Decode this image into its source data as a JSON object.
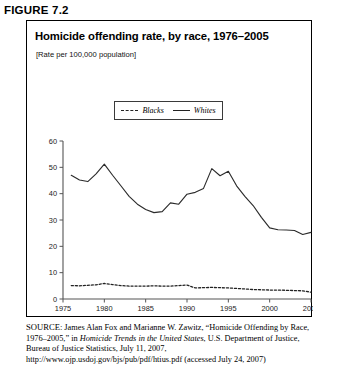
{
  "figure": {
    "label": "FIGURE 7.2",
    "title": "Homicide offending rate, by race, 1976–2005",
    "subtitle": "[Rate per 100,000 population]"
  },
  "legend": {
    "items": [
      {
        "label": "Blacks",
        "style": "dashed"
      },
      {
        "label": "Whites",
        "style": "solid"
      }
    ]
  },
  "source": {
    "prefix": "SOURCE:",
    "text_1": " James Alan Fox and Marianne W. Zawitz, “Homicide Offending by Race, 1976–2005,” in ",
    "italic_1": "Homicide Trends in the United States",
    "text_2": ", U.S. Department of Justice, Bureau of Justice Statistics, July 11, 2007, http://www.ojp.usdoj.gov/bjs/pub/pdf/htius.pdf (accessed July 24, 2007)"
  },
  "chart_data": {
    "type": "line",
    "title": "Homicide offending rate, by race, 1976–2005",
    "xlabel": "",
    "ylabel": "",
    "subtitle": "[Rate per 100,000 population]",
    "xlim": [
      1975,
      2005
    ],
    "ylim": [
      0,
      60
    ],
    "ytick_values": [
      0,
      10,
      20,
      30,
      40,
      50,
      60
    ],
    "ytick_labels": [
      "0",
      "10",
      "20",
      "30",
      "40",
      "50",
      "60"
    ],
    "xtick_values": [
      1975,
      1980,
      1985,
      1990,
      1995,
      2000,
      2005
    ],
    "xtick_labels": [
      "1975",
      "1980",
      "1985",
      "1990",
      "1995",
      "2000",
      "2005"
    ],
    "grid": false,
    "legend_position": "top-center",
    "x": [
      1976,
      1977,
      1978,
      1979,
      1980,
      1981,
      1982,
      1983,
      1984,
      1985,
      1986,
      1987,
      1988,
      1989,
      1990,
      1991,
      1992,
      1993,
      1994,
      1995,
      1996,
      1997,
      1998,
      1999,
      2000,
      2001,
      2002,
      2003,
      2004,
      2005
    ],
    "series": [
      {
        "name": "Blacks",
        "style": "dashed",
        "color": "#222222",
        "values": [
          5.1,
          5.0,
          5.2,
          5.4,
          5.9,
          5.5,
          5.1,
          4.9,
          4.9,
          4.9,
          5.0,
          4.9,
          4.9,
          5.1,
          5.3,
          4.2,
          4.3,
          4.4,
          4.3,
          4.2,
          4.0,
          3.8,
          3.6,
          3.5,
          3.4,
          3.4,
          3.3,
          3.2,
          3.1,
          2.6
        ]
      },
      {
        "name": "Whites",
        "style": "solid",
        "color": "#2b2b2b",
        "values": [
          47.0,
          45.2,
          44.6,
          47.5,
          51.2,
          47.0,
          43.0,
          39.0,
          36.0,
          34.0,
          32.8,
          33.2,
          36.5,
          36.0,
          39.8,
          40.5,
          42.0,
          49.5,
          46.8,
          48.5,
          43.0,
          39.0,
          35.5,
          31.0,
          27.0,
          26.3,
          26.2,
          26.0,
          24.5,
          25.3
        ]
      }
    ]
  }
}
